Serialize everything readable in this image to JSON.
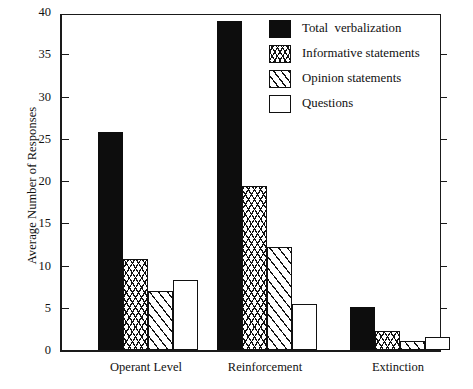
{
  "chart_data": {
    "type": "bar",
    "title": "",
    "xlabel": "",
    "ylabel": "Average Number of Responses",
    "ylim": [
      0,
      40
    ],
    "ytick_values": [
      0,
      5,
      10,
      15,
      20,
      25,
      30,
      35,
      40
    ],
    "ytick_labels": [
      "0",
      "5",
      "10",
      "15",
      "20",
      "25",
      "30",
      "35",
      "40"
    ],
    "grid": false,
    "legend_position": "top-right",
    "categories": [
      "Operant Level",
      "Reinforcement",
      "Extinction"
    ],
    "series": [
      {
        "name": "Total  verbalization",
        "pattern": "solid",
        "values": [
          25.8,
          38.9,
          5.1
        ]
      },
      {
        "name": "Informative statements",
        "pattern": "cross",
        "values": [
          10.8,
          19.4,
          2.2
        ]
      },
      {
        "name": "Opinion statements",
        "pattern": "diag",
        "values": [
          7.0,
          12.2,
          1.1
        ]
      },
      {
        "name": "Questions",
        "pattern": "open",
        "values": [
          8.3,
          5.4,
          1.5
        ]
      }
    ]
  },
  "colors": {
    "ink": "#111111",
    "fill_solid": "#0d0d0d",
    "background": "#ffffff"
  }
}
